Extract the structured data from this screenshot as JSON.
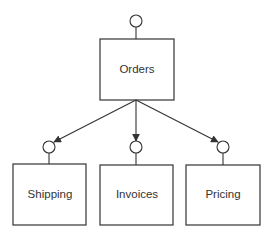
{
  "diagram": {
    "type": "component-dependency",
    "colors": {
      "stroke": "#333333",
      "background": "#ffffff",
      "text": "#333333"
    },
    "nodes": [
      {
        "id": "orders",
        "label": "Orders"
      },
      {
        "id": "shipping",
        "label": "Shipping"
      },
      {
        "id": "invoices",
        "label": "Invoices"
      },
      {
        "id": "pricing",
        "label": "Pricing"
      }
    ],
    "edges": [
      {
        "from": "orders",
        "to": "shipping",
        "style": "arrow-to-interface"
      },
      {
        "from": "orders",
        "to": "invoices",
        "style": "arrow-to-interface"
      },
      {
        "from": "orders",
        "to": "pricing",
        "style": "arrow-to-interface"
      }
    ]
  }
}
